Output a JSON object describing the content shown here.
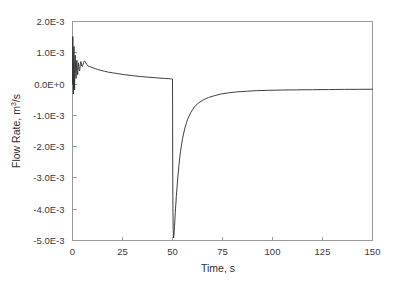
{
  "figure": {
    "background_color": "#ffffff",
    "axis_color": "#9a9a9a",
    "line_color": "#2a2a2a"
  },
  "chart_data": {
    "type": "line",
    "title": "",
    "xlabel": "Time, s",
    "ylabel": "Flow Rate, m3/s",
    "ylabel_base": "Flow Rate, m",
    "ylabel_sup": "3",
    "ylabel_tail": "/s",
    "xlim": [
      0,
      150
    ],
    "ylim": [
      -0.005,
      0.002
    ],
    "grid": false,
    "legend": null,
    "xticks": [
      0,
      25,
      50,
      75,
      100,
      125,
      150
    ],
    "xtick_labels": [
      "0",
      "25",
      "50",
      "75",
      "100",
      "125",
      "150"
    ],
    "yticks": [
      0.002,
      0.001,
      0.0,
      -0.001,
      -0.002,
      -0.003,
      -0.004,
      -0.005
    ],
    "ytick_labels": [
      "2.0E-3",
      "1.0E-3",
      "0.0E+0",
      "-1.0E-3",
      "-2.0E-3",
      "-3.0E-3",
      "-4.0E-3",
      "-5.0E-3"
    ],
    "series": [
      {
        "name": "Flow Rate",
        "x": [
          0,
          0.15,
          0.3,
          0.45,
          0.6,
          0.75,
          0.9,
          1.05,
          1.2,
          1.4,
          1.6,
          1.8,
          2.0,
          2.2,
          2.4,
          2.6,
          2.8,
          3.0,
          3.3,
          3.6,
          3.9,
          4.2,
          4.6,
          5.0,
          5.5,
          6.0,
          6.6,
          7.2,
          7.8,
          8.4,
          9.0,
          9.8,
          10.6,
          11.5,
          12.5,
          14.0,
          16.0,
          18.0,
          20.0,
          23.0,
          26.0,
          30.0,
          34.0,
          38.0,
          42.0,
          46.0,
          49.0,
          49.6,
          49.9,
          50.0,
          50.05,
          50.1,
          50.2,
          50.35,
          50.5,
          50.7,
          51.0,
          51.4,
          51.9,
          52.5,
          53.2,
          54.0,
          55.0,
          56.2,
          57.6,
          59.2,
          61.0,
          63.0,
          65.5,
          68.0,
          71.0,
          74.0,
          78.0,
          82.0,
          87.0,
          92.0,
          98.0,
          105.0,
          112.0,
          120.0,
          128.0,
          136.0,
          143.0,
          150.0
        ],
        "y": [
          0.0,
          0.00152,
          0.00048,
          -0.00032,
          0.00098,
          0.0012,
          0.0002,
          -0.00018,
          0.00072,
          0.00092,
          0.00034,
          0.00018,
          0.0006,
          0.00076,
          0.0004,
          0.0003,
          0.00056,
          0.00068,
          0.00046,
          0.00042,
          0.00062,
          0.00072,
          0.00058,
          0.00056,
          0.00068,
          0.00074,
          0.00068,
          0.00062,
          0.00058,
          0.00056,
          0.00055,
          0.00053,
          0.00051,
          0.00049,
          0.00047,
          0.00044,
          0.00041,
          0.00038,
          0.00036,
          0.00033,
          0.0003,
          0.00027,
          0.00024,
          0.00022,
          0.0002,
          0.00018,
          0.00017,
          0.000165,
          0.00016,
          0.00016,
          -0.0008,
          -0.0024,
          -0.0039,
          -0.00465,
          -0.00492,
          -0.00485,
          -0.00455,
          -0.0041,
          -0.0036,
          -0.0031,
          -0.0026,
          -0.00215,
          -0.00175,
          -0.0014,
          -0.00112,
          -0.0009,
          -0.00073,
          -0.0006,
          -0.0005,
          -0.00043,
          -0.00037,
          -0.00032,
          -0.00028,
          -0.00025,
          -0.00023,
          -0.00021,
          -0.0002,
          -0.00019,
          -0.000185,
          -0.00018,
          -0.000175,
          -0.00017,
          -0.000168,
          -0.000165
        ]
      }
    ]
  }
}
